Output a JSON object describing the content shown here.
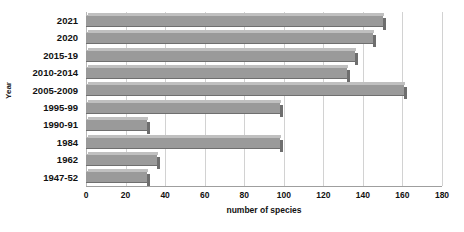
{
  "chart_data": {
    "type": "bar",
    "orientation": "horizontal",
    "title": "",
    "xlabel": "number of species",
    "ylabel": "Year",
    "categories": [
      "2021",
      "2020",
      "2015-19",
      "2010-2014",
      "2005-2009",
      "1995-99",
      "1990-91",
      "1984",
      "1962",
      "1947-52"
    ],
    "values": [
      150,
      145,
      136,
      132,
      161,
      98,
      31,
      98,
      36,
      31
    ],
    "xlim": [
      0,
      180
    ],
    "xticks": [
      0,
      20,
      40,
      60,
      80,
      100,
      120,
      140,
      160,
      180
    ],
    "xtick_labels": [
      "0",
      "20",
      "40",
      "60",
      "80",
      "100",
      "120",
      "140",
      "160",
      "180"
    ],
    "grid": "vertical",
    "legend": "none",
    "bar_color": "#9a9a9a",
    "gridline_color": "#d2d2d2",
    "background_color": "#ffffff"
  }
}
